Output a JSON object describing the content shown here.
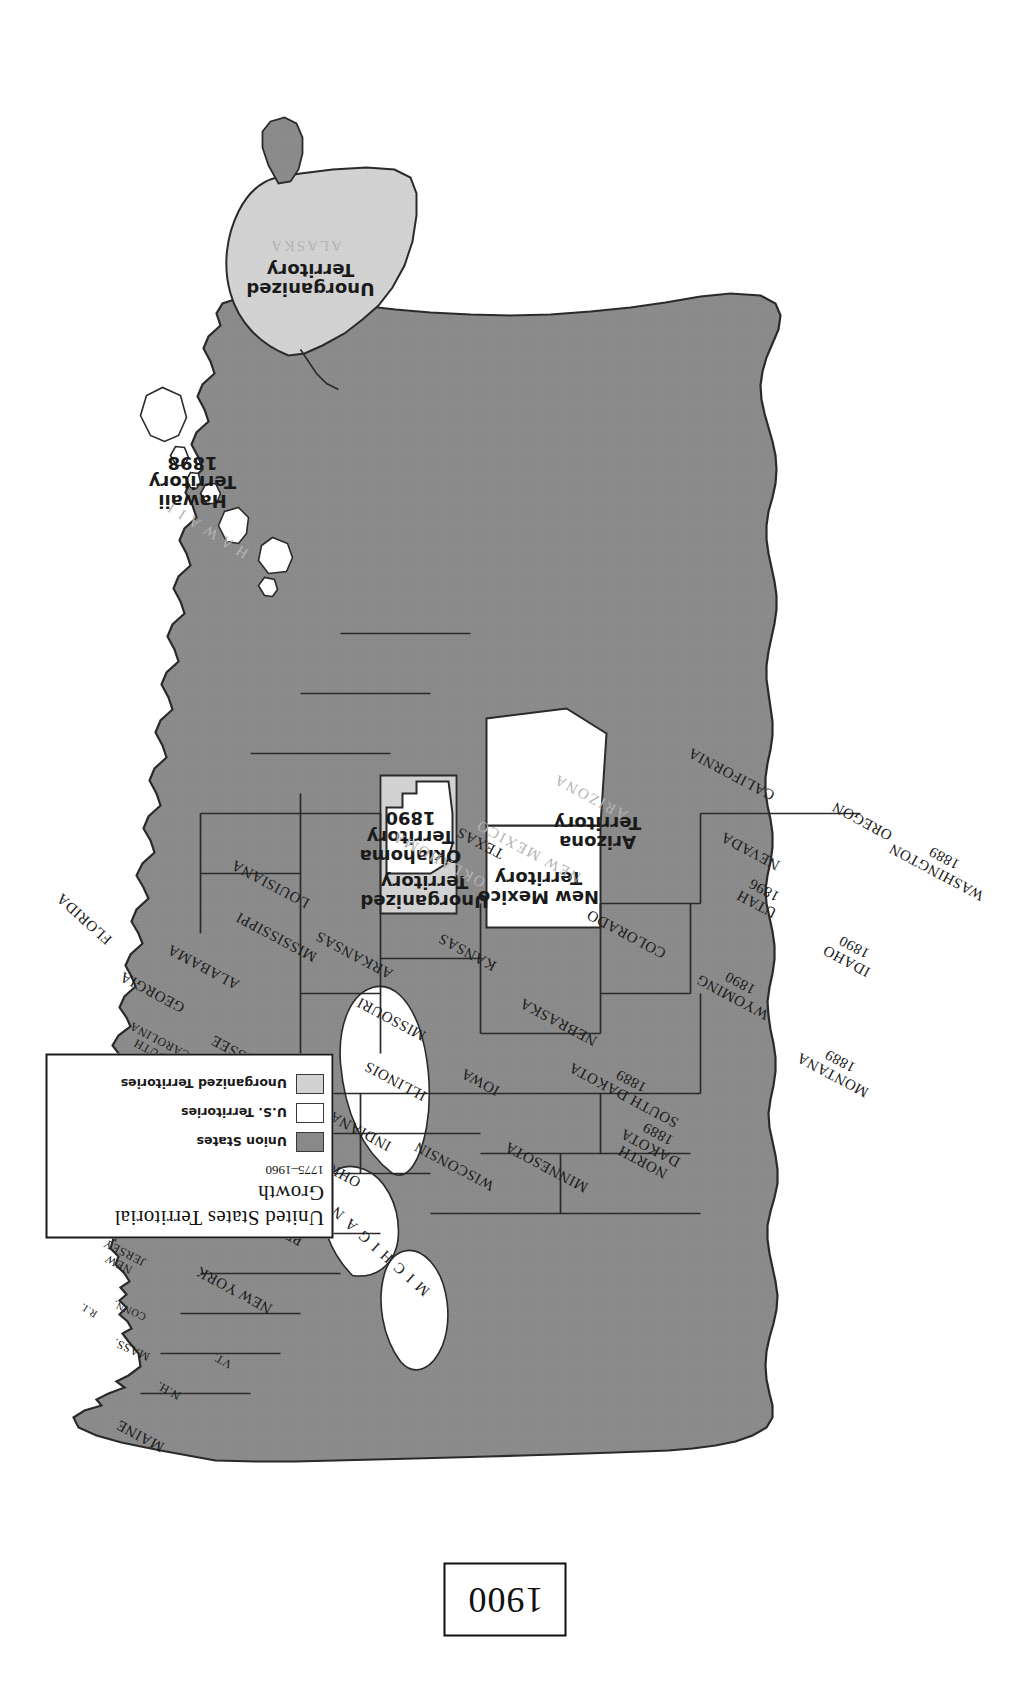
{
  "map": {
    "domain": "Map",
    "kind": "historical-thematic-map",
    "orientation_note": "map rendered rotated 90 degrees counter-clockwise on the page",
    "year_box": {
      "label": "1900"
    },
    "colors": {
      "union_states_fill": "#898989",
      "us_territories_fill": "#ffffff",
      "unorganized_territories_fill": "#d2d2d2",
      "outline": "#2a2a2a",
      "background": "#ffffff",
      "ghost_label": "#b4b4b4"
    }
  },
  "legend": {
    "title": "United States Territorial Growth",
    "subtitle": "1775–1960",
    "entries": [
      {
        "label": "Union States",
        "swatch": "union"
      },
      {
        "label": "U.S. Territories",
        "swatch": "usterr"
      },
      {
        "label": "Unorganized Territories",
        "swatch": "unorg"
      }
    ]
  },
  "labels": {
    "states": [
      {
        "name": "MAINE",
        "x": 258,
        "y": 140,
        "rot": -62,
        "cls": "state"
      },
      {
        "name": "VT.",
        "x": 333,
        "y": 222,
        "rot": -62,
        "cls": "small"
      },
      {
        "name": "N.H.",
        "x": 303,
        "y": 168,
        "rot": -62,
        "cls": "small"
      },
      {
        "name": "MASS.",
        "x": 344,
        "y": 131,
        "rot": -66,
        "cls": "small"
      },
      {
        "name": "CONN.",
        "x": 383,
        "y": 129,
        "rot": -66,
        "cls": "tiny"
      },
      {
        "name": "R.I.",
        "x": 383,
        "y": 88,
        "rot": -58,
        "cls": "tiny"
      },
      {
        "name": "NEW YORK",
        "x": 404,
        "y": 234,
        "rot": -62,
        "cls": "state"
      },
      {
        "name": "NEW\nJERSEY",
        "x": 435,
        "y": 121,
        "rot": -63,
        "cls": "small"
      },
      {
        "name": "PENNSYLVANIA",
        "x": 480,
        "y": 249,
        "rot": -62,
        "cls": "state"
      },
      {
        "name": "DELAWARE",
        "x": 472,
        "y": 88,
        "rot": -61,
        "cls": "small"
      },
      {
        "name": "MD.",
        "x": 509,
        "y": 136,
        "rot": -62,
        "cls": "small"
      },
      {
        "name": "D.C.",
        "x": 512,
        "y": 103,
        "rot": -62,
        "cls": "tiny"
      },
      {
        "name": "VIRGINIA",
        "x": 545,
        "y": 189,
        "rot": -62,
        "cls": "state"
      },
      {
        "name": "WEST\nVIRGINIA",
        "x": 522,
        "y": 243,
        "rot": -62,
        "cls": "tiny"
      },
      {
        "name": "NORTH CAROLINA",
        "x": 600,
        "y": 167,
        "rot": -62,
        "cls": "state"
      },
      {
        "name": "SOUTH\nCAROLINA",
        "x": 647,
        "y": 156,
        "rot": -62,
        "cls": "small"
      },
      {
        "name": "GEORGIA",
        "x": 702,
        "y": 152,
        "rot": -62,
        "cls": "state"
      },
      {
        "name": "FLORIDA",
        "x": 775,
        "y": 84,
        "rot": -48,
        "cls": "state"
      },
      {
        "name": "ALABAMA",
        "x": 727,
        "y": 203,
        "rot": -62,
        "cls": "state"
      },
      {
        "name": "MISSISSIPPI",
        "x": 757,
        "y": 276,
        "rot": -62,
        "cls": "state"
      },
      {
        "name": "TENNESSEE",
        "x": 634,
        "y": 251,
        "rot": -62,
        "cls": "state"
      },
      {
        "name": "KENTUCKY",
        "x": 591,
        "y": 258,
        "rot": -62,
        "cls": "state"
      },
      {
        "name": "OHIO",
        "x": 520,
        "y": 342,
        "rot": -62,
        "cls": "state"
      },
      {
        "name": "INDIANA",
        "x": 563,
        "y": 360,
        "rot": -62,
        "cls": "state"
      },
      {
        "name": "ILLINOIS",
        "x": 613,
        "y": 395,
        "rot": -62,
        "cls": "state"
      },
      {
        "name": "MICHIGAN",
        "x": 445,
        "y": 378,
        "rot": -48,
        "cls": "spread"
      },
      {
        "name": "WISCONSIN",
        "x": 528,
        "y": 454,
        "rot": -62,
        "cls": "state"
      },
      {
        "name": "LOUISIANA",
        "x": 810,
        "y": 270,
        "rot": -62,
        "cls": "state"
      },
      {
        "name": "ARKANSAS",
        "x": 739,
        "y": 354,
        "rot": -62,
        "cls": "state"
      },
      {
        "name": "MISSOURI",
        "x": 675,
        "y": 391,
        "rot": -62,
        "cls": "state"
      },
      {
        "name": "IOWA",
        "x": 612,
        "y": 480,
        "rot": -62,
        "cls": "state"
      },
      {
        "name": "MINNESOTA",
        "x": 527,
        "y": 546,
        "rot": -62,
        "cls": "state"
      },
      {
        "name": "KANSAS",
        "x": 742,
        "y": 467,
        "rot": -62,
        "cls": "state"
      },
      {
        "name": "NEBRASKA",
        "x": 672,
        "y": 558,
        "rot": -62,
        "cls": "state"
      },
      {
        "name": "TEXAS",
        "x": 851,
        "y": 480,
        "rot": -62,
        "cls": "state"
      },
      {
        "name": "COLORADO",
        "x": 760,
        "y": 626,
        "rot": -62,
        "cls": "state"
      },
      {
        "name": "CALIFORNIA",
        "x": 920,
        "y": 731,
        "rot": -62,
        "cls": "state"
      },
      {
        "name": "NEVADA",
        "x": 843,
        "y": 750,
        "rot": -62,
        "cls": "state"
      },
      {
        "name": "OREGON",
        "x": 873,
        "y": 862,
        "rot": -62,
        "cls": "state"
      }
    ],
    "states_with_year": [
      {
        "name": "NORTH\nDAKOTA",
        "year": "1889",
        "x": 546,
        "y": 650,
        "rot": -62
      },
      {
        "name": "SOUTH DAKOTA",
        "year": "1889",
        "x": 606,
        "y": 627,
        "rot": -62
      },
      {
        "name": "MONTANA",
        "year": "1889",
        "x": 626,
        "y": 836,
        "rot": -62
      },
      {
        "name": "WYOMING",
        "year": "1890",
        "x": 704,
        "y": 736,
        "rot": -62
      },
      {
        "name": "IDAHO",
        "year": "1890",
        "x": 740,
        "y": 850,
        "rot": -62
      },
      {
        "name": "UTAH",
        "year": "1896",
        "x": 797,
        "y": 760,
        "rot": -62
      },
      {
        "name": "WASHINGTON",
        "year": "1889",
        "x": 829,
        "y": 940,
        "rot": -62
      }
    ],
    "territories": [
      {
        "name": "Arizona\nTerritory",
        "ghost": "ARIZONA",
        "x": 861,
        "y": 597,
        "rot": -90,
        "ghost_x": 897,
        "ghost_y": 590,
        "ghost_rot": -62
      },
      {
        "name": "New Mexico\nTerritory",
        "ghost": "NEW MEXICO",
        "x": 806,
        "y": 538,
        "rot": -90,
        "ghost_x": 843,
        "ghost_y": 528,
        "ghost_rot": -62
      },
      {
        "name": "Oklahoma\nTerritory\n1890",
        "ghost": "",
        "x": 857,
        "y": 410,
        "rot": -90,
        "ghost_x": 0,
        "ghost_y": 0,
        "ghost_rot": 0
      },
      {
        "name": "Unorganized\nTerritory",
        "ghost": "OKLAHOMA",
        "x": 802,
        "y": 424,
        "rot": -90,
        "ghost_x": 835,
        "ghost_y": 438,
        "ghost_rot": -62
      },
      {
        "name": "Hawaii\nTerritory\n1898",
        "ghost": "H A W A I I",
        "x": 1212,
        "y": 192,
        "rot": -90,
        "ghost_x": 1164,
        "ghost_y": 207,
        "ghost_rot": -58
      },
      {
        "name": "Unorganized\nTerritory",
        "ghost": "ALASKA",
        "x": 1414,
        "y": 310,
        "rot": -90,
        "ghost_x": 1448,
        "ghost_y": 305,
        "ghost_rot": -90
      }
    ]
  }
}
